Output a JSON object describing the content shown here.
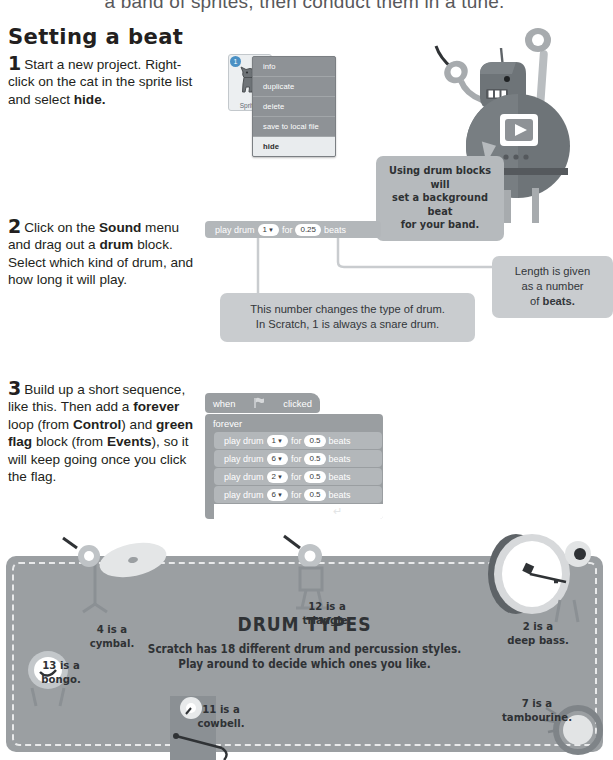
{
  "banner": {
    "text": "a band of sprites, then conduct them in a tune."
  },
  "section": {
    "title": "Setting a beat"
  },
  "steps": [
    {
      "number": "1",
      "lines": [
        [
          {
            "t": "Start a new project.",
            "b": false
          }
        ],
        [
          {
            "t": "Right-click on the cat in the",
            "b": false
          }
        ],
        [
          {
            "t": "sprite list and select ",
            "b": false
          },
          {
            "t": "hide.",
            "b": true
          }
        ]
      ]
    },
    {
      "number": "2",
      "lines": [
        [
          {
            "t": "Click on the ",
            "b": false
          },
          {
            "t": "Sound",
            "b": true
          },
          {
            "t": " menu",
            "b": false
          }
        ],
        [
          {
            "t": "and drag out a ",
            "b": false
          },
          {
            "t": "drum",
            "b": true
          },
          {
            "t": " block.",
            "b": false
          }
        ],
        [
          {
            "t": "Select which kind of drum,",
            "b": false
          }
        ],
        [
          {
            "t": "and how long it will play.",
            "b": false
          }
        ]
      ]
    },
    {
      "number": "3",
      "lines": [
        [
          {
            "t": "Build up a short sequence,",
            "b": false
          }
        ],
        [
          {
            "t": "like this. Then add a ",
            "b": false
          },
          {
            "t": "forever",
            "b": true
          }
        ],
        [
          {
            "t": "loop (from ",
            "b": false
          },
          {
            "t": "Control",
            "b": true
          },
          {
            "t": ") and",
            "b": false
          }
        ],
        [
          {
            "t": "green flag",
            "b": true
          },
          {
            "t": " block (from",
            "b": false
          }
        ],
        [
          {
            "t": "Events",
            "b": true
          },
          {
            "t": "), so it will keep going",
            "b": false
          }
        ],
        [
          {
            "t": "once you click the flag.",
            "b": false
          }
        ]
      ]
    }
  ],
  "sprite_panel": {
    "badge": "1",
    "label": "Sprite1",
    "icon": "scratch-cat-icon"
  },
  "context_menu": {
    "items": [
      {
        "label": "info",
        "selected": false
      },
      {
        "label": "duplicate",
        "selected": false
      },
      {
        "label": "delete",
        "selected": false
      },
      {
        "label": "save to local file",
        "selected": false
      },
      {
        "label": "hide",
        "selected": true
      }
    ]
  },
  "speech_bubble": {
    "lines": [
      "Using drum blocks will",
      "set a background beat",
      "for your band."
    ]
  },
  "drum_block_solo": {
    "label_start": "play drum",
    "drum": "1",
    "caret": "▼",
    "label_for": "for",
    "beats": "0.25",
    "label_end": "beats"
  },
  "script": {
    "hat_label_start": "when",
    "hat_flag_icon": "green-flag-icon",
    "hat_label_end": "clicked",
    "forever_label": "forever",
    "loop_arrow": "↵",
    "blocks": [
      {
        "label_start": "play drum",
        "drum": "1",
        "caret": "▼",
        "label_for": "for",
        "beats": "0.5",
        "label_end": "beats"
      },
      {
        "label_start": "play drum",
        "drum": "6",
        "caret": "▼",
        "label_for": "for",
        "beats": "0.5",
        "label_end": "beats"
      },
      {
        "label_start": "play drum",
        "drum": "2",
        "caret": "▼",
        "label_for": "for",
        "beats": "0.5",
        "label_end": "beats"
      },
      {
        "label_start": "play drum",
        "drum": "6",
        "caret": "▼",
        "label_for": "for",
        "beats": "0.5",
        "label_end": "beats"
      }
    ]
  },
  "callouts": {
    "drum_type": {
      "lines": [
        "This number changes the type of drum.",
        "In Scratch, 1 is always a snare drum."
      ]
    },
    "beats": {
      "lines": [
        [
          {
            "t": "Length is given",
            "b": false
          }
        ],
        [
          {
            "t": "as a number",
            "b": false
          }
        ],
        [
          {
            "t": "of ",
            "b": false
          },
          {
            "t": "beats.",
            "b": true
          }
        ]
      ]
    }
  },
  "drum_types_panel": {
    "title": "DRUM TYPES",
    "subtitle_lines": [
      "Scratch has 18 different drum and percussion styles.",
      "Play around to decide which ones you like."
    ],
    "labels": [
      {
        "id": "cymbal",
        "lines": [
          "4 is a",
          "cymbal."
        ]
      },
      {
        "id": "triangle",
        "lines": [
          "12 is a",
          "triangle."
        ]
      },
      {
        "id": "deep-bass",
        "lines": [
          "2 is a",
          "deep bass."
        ]
      },
      {
        "id": "bongo",
        "lines": [
          "13 is a",
          "bongo."
        ]
      },
      {
        "id": "cowbell",
        "lines": [
          "11 is a",
          "cowbell."
        ]
      },
      {
        "id": "tambourine",
        "lines": [
          "7 is a",
          "tambourine."
        ]
      }
    ]
  },
  "colors": {
    "block_grey": "#b3b7ba",
    "panel_grey": "#9b9fa2",
    "callout_grey": "#c9cccf",
    "menu_grey": "#8e9296",
    "ink": "#231f20"
  }
}
